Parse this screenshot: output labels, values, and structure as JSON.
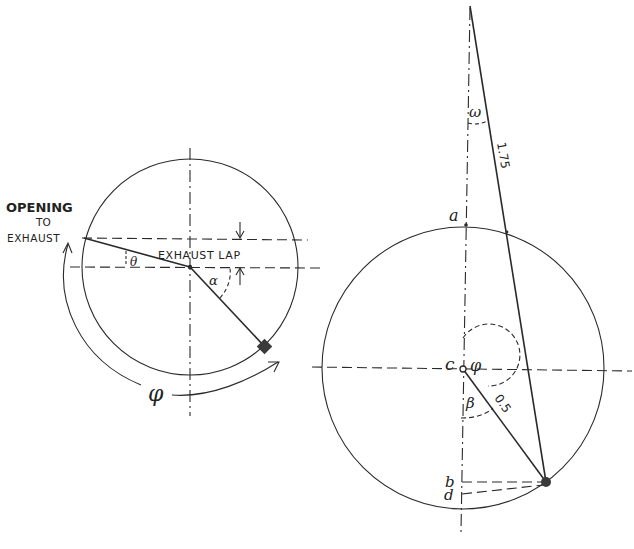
{
  "left_diagram": {
    "label_opening_line1": "OPENING",
    "label_opening_line2": "TO",
    "label_opening_line3": "EXHAUST",
    "label_exhaust_lap": "EXHAUST LAP",
    "symbol_theta": "θ",
    "symbol_alpha": "α",
    "symbol_phi": "φ"
  },
  "right_diagram": {
    "point_a": "a",
    "point_c": "c",
    "point_b": "b",
    "point_d": "d",
    "symbol_omega": "ω",
    "symbol_phi": "φ",
    "symbol_beta": "β",
    "rod_length": "1.75",
    "crank_length": "0.5"
  },
  "colors": {
    "ink": "#2a2a2a",
    "background": "#ffffff"
  }
}
